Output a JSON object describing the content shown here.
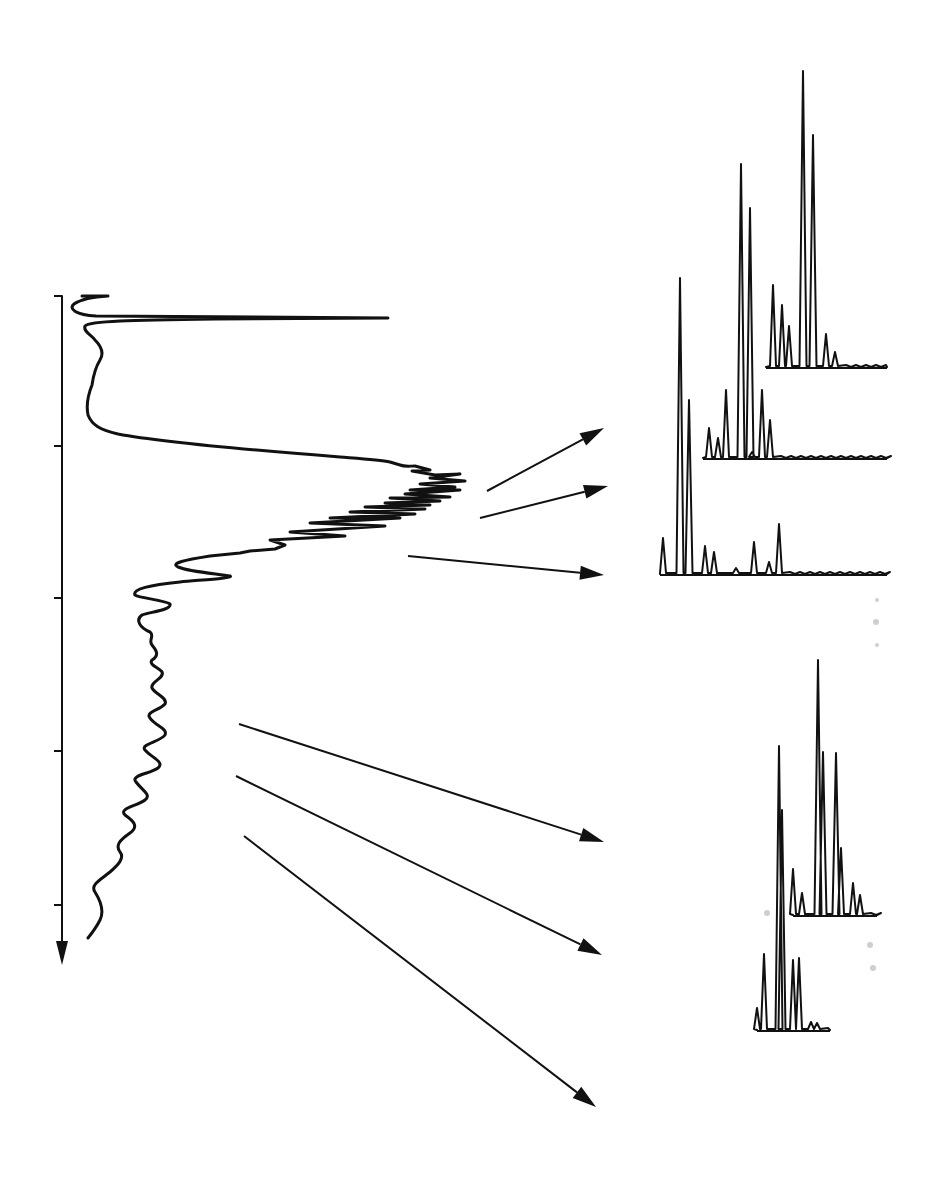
{
  "figure": {
    "colors": {
      "ink": "#111111",
      "background": "#ffffff",
      "smudge": "#cfcfcf"
    }
  },
  "axis": {
    "orientation": "vertical-down",
    "x": 62,
    "y_start": 296,
    "y_end": 965,
    "ticks_y": [
      296,
      446,
      598,
      751,
      905
    ],
    "tick_labels": []
  },
  "chromatogram": {
    "solvent_peak_y": 318,
    "solvent_peak_max_x": 388,
    "region_dense_peaks": [
      455,
      540
    ],
    "region_late_peaks": [
      650,
      935
    ]
  },
  "arrows": [
    {
      "from": [
        487,
        491
      ],
      "to": [
        604,
        428
      ],
      "target": "spectrum-top-1"
    },
    {
      "from": [
        480,
        518
      ],
      "to": [
        608,
        486
      ],
      "target": "spectrum-top-2"
    },
    {
      "from": [
        408,
        556
      ],
      "to": [
        604,
        575
      ],
      "target": "spectrum-top-3"
    },
    {
      "from": [
        239,
        724
      ],
      "to": [
        604,
        842
      ],
      "target": "spectrum-bottom-1"
    },
    {
      "from": [
        236,
        776
      ],
      "to": [
        602,
        955
      ],
      "target": "spectrum-bottom-2"
    },
    {
      "from": [
        244,
        836
      ],
      "to": [
        596,
        1107
      ],
      "target": "spectrum-bottom-3"
    }
  ],
  "spectra": [
    {
      "id": "spectrum-top-1",
      "baseline_y": 367,
      "x_start": 766,
      "x_end": 887,
      "peaks": [
        {
          "x": 773,
          "h": 82
        },
        {
          "x": 782,
          "h": 62
        },
        {
          "x": 789,
          "h": 41
        },
        {
          "x": 803,
          "h": 296
        },
        {
          "x": 813,
          "h": 232
        },
        {
          "x": 826,
          "h": 33
        },
        {
          "x": 835,
          "h": 15
        }
      ]
    },
    {
      "id": "spectrum-top-2",
      "baseline_y": 458,
      "x_start": 703,
      "x_end": 887,
      "peaks": [
        {
          "x": 709,
          "h": 30
        },
        {
          "x": 718,
          "h": 20
        },
        {
          "x": 726,
          "h": 68
        },
        {
          "x": 741,
          "h": 294
        },
        {
          "x": 750,
          "h": 250
        },
        {
          "x": 752,
          "h": 6
        },
        {
          "x": 762,
          "h": 68
        },
        {
          "x": 770,
          "h": 38
        }
      ]
    },
    {
      "id": "spectrum-top-3",
      "baseline_y": 574,
      "x_start": 660,
      "x_end": 887,
      "peaks": [
        {
          "x": 663,
          "h": 36
        },
        {
          "x": 680,
          "h": 296
        },
        {
          "x": 689,
          "h": 174
        },
        {
          "x": 705,
          "h": 28
        },
        {
          "x": 714,
          "h": 22
        },
        {
          "x": 736,
          "h": 6
        },
        {
          "x": 754,
          "h": 32
        },
        {
          "x": 769,
          "h": 12
        },
        {
          "x": 779,
          "h": 50
        }
      ]
    },
    {
      "id": "spectrum-bottom-1",
      "baseline_y": 915,
      "x_start": 793,
      "x_end": 877,
      "peaks": [
        {
          "x": 793,
          "h": 46
        },
        {
          "x": 802,
          "h": 22
        },
        {
          "x": 818,
          "h": 255
        },
        {
          "x": 823,
          "h": 163
        },
        {
          "x": 836,
          "h": 162
        },
        {
          "x": 841,
          "h": 67
        },
        {
          "x": 853,
          "h": 32
        },
        {
          "x": 860,
          "h": 20
        }
      ]
    },
    {
      "id": "spectrum-bottom-2",
      "baseline_y": 1030,
      "x_start": 757,
      "x_end": 830,
      "peaks": [
        {
          "x": 757,
          "h": 22
        },
        {
          "x": 764,
          "h": 76
        },
        {
          "x": 779,
          "h": 284
        },
        {
          "x": 782,
          "h": 220
        },
        {
          "x": 793,
          "h": 70
        },
        {
          "x": 799,
          "h": 72
        },
        {
          "x": 811,
          "h": 8
        },
        {
          "x": 817,
          "h": 7
        }
      ]
    }
  ]
}
